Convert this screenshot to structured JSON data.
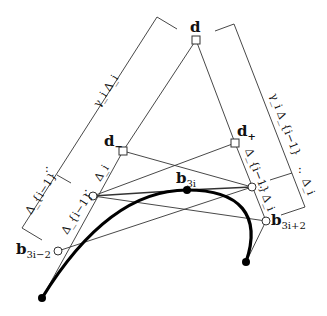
{
  "diagram": {
    "labels": {
      "d": "d",
      "d_minus_base": "d",
      "d_minus_sub": "−",
      "d_plus_base": "d",
      "d_plus_sub": "+",
      "b3i_base": "b",
      "b3i_sub": "3i",
      "b3im2_base": "b",
      "b3im2_sub": "3i−2",
      "b3ip2_base": "b",
      "b3ip2_sub": "3i+2",
      "left_bracket_top": "γ_i Δ_i",
      "left_bracket_bottom": "Δ_{i−1}",
      "right_bracket_top": "γ_i Δ_{i−1}",
      "right_bracket_bottom": "Δ_i",
      "left_edge_upper": "Δ_i",
      "left_edge_lower": "Δ_{i−1}",
      "right_edge_upper": "Δ_{i−1}",
      "right_edge_lower": "Δ_i",
      "ratio_colon": ":"
    },
    "points": {
      "d": [
        196,
        40
      ],
      "d_minus": [
        123,
        151
      ],
      "d_plus": [
        235,
        143
      ],
      "left_mid": [
        93,
        196
      ],
      "right_mid": [
        252,
        187
      ],
      "b3i": [
        187,
        190
      ],
      "b3i_minus_2": [
        58,
        251
      ],
      "b3i_plus_2": [
        266,
        221
      ],
      "start": [
        42,
        298
      ],
      "end": [
        246,
        262
      ]
    }
  }
}
